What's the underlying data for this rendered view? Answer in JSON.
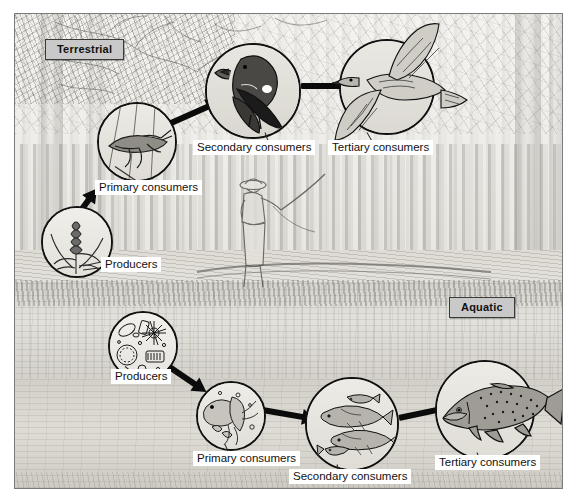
{
  "figure": {
    "style": "pencil sketch illustration"
  },
  "zones": [
    {
      "id": "terrestrial",
      "label": "Terrestrial"
    },
    {
      "id": "aquatic",
      "label": "Aquatic"
    }
  ],
  "terrestrial": {
    "zone_label": "Terrestrial",
    "nodes": [
      {
        "id": "t-producers",
        "label": "Producers",
        "organism": "grasses-and-seed-heads"
      },
      {
        "id": "t-primary",
        "label": "Primary consumers",
        "organism": "grasshopper"
      },
      {
        "id": "t-secondary",
        "label": "Secondary consumers",
        "organism": "songbird"
      },
      {
        "id": "t-tertiary",
        "label": "Tertiary consumers",
        "organism": "hawk"
      }
    ]
  },
  "aquatic": {
    "zone_label": "Aquatic",
    "nodes": [
      {
        "id": "a-producers",
        "label": "Producers",
        "organism": "phytoplankton-diatoms"
      },
      {
        "id": "a-primary",
        "label": "Primary consumers",
        "organism": "zooplankton-copepods"
      },
      {
        "id": "a-secondary",
        "label": "Secondary consumers",
        "organism": "minnows"
      },
      {
        "id": "a-tertiary",
        "label": "Tertiary consumers",
        "organism": "trout"
      }
    ]
  },
  "scene": {
    "background_elements": [
      "bare-winter-trees",
      "forest-trunks",
      "stream-bank",
      "pond-water",
      "marsh-grass",
      "fly-fisherman"
    ]
  },
  "colors": {
    "tag_fill": "#c9c9c9",
    "tag_border": "#3a3a3a",
    "caption_fill": "#ffffff",
    "ink": "#111111",
    "plate_border": "#7b7b7b",
    "paper": "#e9e7e2"
  }
}
